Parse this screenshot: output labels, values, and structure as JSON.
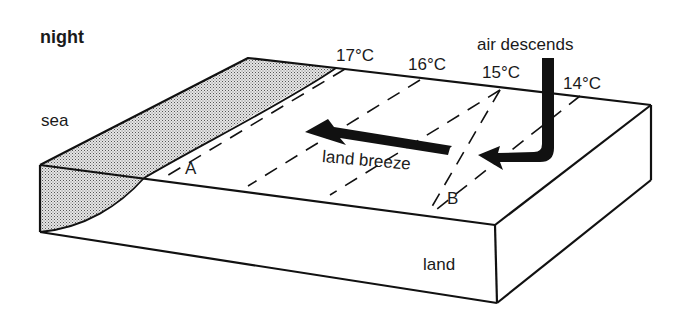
{
  "title": "night",
  "labels": {
    "sea": "sea",
    "land": "land",
    "breeze": "land breeze",
    "descends": "air descends",
    "point_a": "A",
    "point_b": "B"
  },
  "isotherms": [
    {
      "label": "17°C"
    },
    {
      "label": "16°C"
    },
    {
      "label": "15°C"
    },
    {
      "label": "14°C"
    }
  ],
  "colors": {
    "line": "#111111",
    "sea_fill": "#c8c8c8",
    "background": "#ffffff"
  }
}
